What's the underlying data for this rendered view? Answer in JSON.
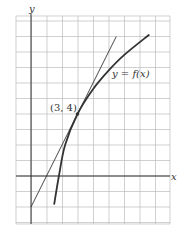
{
  "chart_data": {
    "type": "line",
    "title": "",
    "xlabel": "x",
    "ylabel": "y",
    "xlim": [
      -1,
      9
    ],
    "ylim": [
      -3,
      10
    ],
    "grid": true,
    "grid_step": 1,
    "series": [
      {
        "name": "y = f(x)",
        "kind": "curve",
        "points": [
          [
            1.5,
            -1.8
          ],
          [
            1.8,
            0
          ],
          [
            2.2,
            2
          ],
          [
            3,
            4
          ],
          [
            4,
            5.6
          ],
          [
            5,
            6.8
          ],
          [
            6,
            7.8
          ],
          [
            7.6,
            9.1
          ]
        ]
      },
      {
        "name": "tangent line at (3, 4)",
        "kind": "line",
        "slope": 2,
        "intercept": -2,
        "points": [
          [
            0,
            -2
          ],
          [
            3,
            4
          ],
          [
            5.5,
            9
          ]
        ]
      }
    ],
    "annotations": [
      {
        "text": "(3, 4)",
        "x": 3,
        "y": 4,
        "marker": "point"
      },
      {
        "text": "y = f(x)",
        "x": 5.2,
        "y": 6.5
      }
    ]
  },
  "labels": {
    "x_axis": "x",
    "y_axis": "y",
    "point": "(3, 4)",
    "curve": "y = f(x)"
  }
}
